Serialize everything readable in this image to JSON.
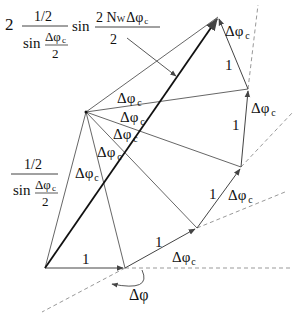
{
  "diagram": {
    "type": "phasor-sum-geometry",
    "colors": {
      "line": "#444444",
      "thick": "#111111",
      "dashed": "#999999",
      "text": "#111111"
    },
    "points": {
      "origin": [
        45,
        268
      ],
      "p1": [
        125,
        268
      ],
      "p2": [
        197,
        228
      ],
      "p3": [
        241,
        167
      ],
      "p4": [
        248,
        89
      ],
      "p5": [
        218,
        17
      ],
      "hub": [
        86,
        112
      ]
    },
    "labels": {
      "delta_phi_c": "Δφ",
      "sub_c": "c",
      "delta_phi": "Δφ",
      "one": "1",
      "formula_top": {
        "coef": "2",
        "num": "1/2",
        "den_sin": "sin",
        "den_num": "Δφ",
        "den_sub": "c",
        "den_den": "2",
        "sin": "sin",
        "arg_num_pre": "2 N",
        "arg_num_sub": "W",
        "arg_num_post": "Δφ",
        "arg_num_post_sub": "c",
        "arg_den": "2"
      },
      "formula_left": {
        "num": "1/2",
        "den_sin": "sin",
        "den_num": "Δφ",
        "den_sub": "c",
        "den_den": "2"
      }
    }
  }
}
